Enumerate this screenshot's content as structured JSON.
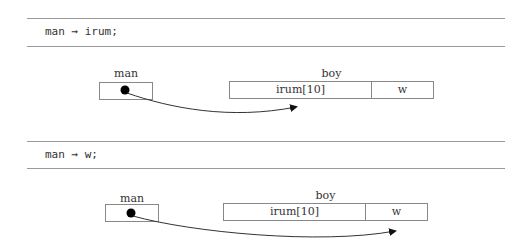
{
  "panels": [
    {
      "code": "man → irum;",
      "pointer_label": "man",
      "struct_label": "boy",
      "fields": [
        "irum[10]",
        "w"
      ],
      "arrow_target": "irum[10]"
    },
    {
      "code": "man → w;",
      "pointer_label": "man",
      "struct_label": "boy",
      "fields": [
        "irum[10]",
        "w"
      ],
      "arrow_target": "w"
    }
  ]
}
